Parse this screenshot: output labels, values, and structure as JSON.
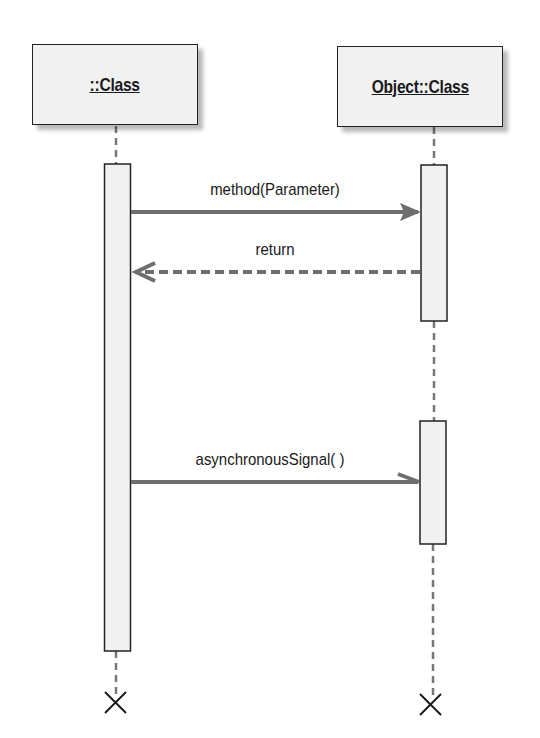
{
  "diagram": {
    "type": "UML sequence diagram",
    "lifelines": [
      {
        "id": "left",
        "title": "::Class"
      },
      {
        "id": "right",
        "title": "Object::Class"
      }
    ],
    "messages": [
      {
        "label": "method(Parameter)",
        "from": "left",
        "to": "right",
        "kind": "synchronous"
      },
      {
        "label": "return",
        "from": "right",
        "to": "left",
        "kind": "return"
      },
      {
        "label": "asynchronousSignal( )",
        "from": "left",
        "to": "right",
        "kind": "asynchronous"
      }
    ],
    "colors": {
      "box_fill": "#f1f1f1",
      "outline": "#222222",
      "arrow": "#6e6e6e",
      "lifeline": "#777777"
    }
  }
}
